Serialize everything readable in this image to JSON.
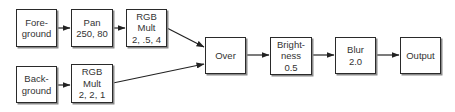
{
  "diagram": {
    "type": "node-graph",
    "colors": {
      "border": "#2a2a2a",
      "shadow": "#8a8a8a",
      "text": "#333333",
      "arrow": "#222222"
    },
    "nodes": {
      "foreground": {
        "lines": [
          "Fore-",
          "ground"
        ]
      },
      "pan": {
        "lines": [
          "Pan",
          "250, 80"
        ]
      },
      "rgb_mult_top": {
        "lines": [
          "RGB",
          "Mult",
          "2, .5, 4"
        ]
      },
      "background": {
        "lines": [
          "Back-",
          "ground"
        ]
      },
      "rgb_mult_bottom": {
        "lines": [
          "RGB",
          "Mult",
          "2, 2, 1"
        ]
      },
      "over": {
        "lines": [
          "Over"
        ]
      },
      "brightness": {
        "lines": [
          "Bright-",
          "ness",
          "0.5"
        ]
      },
      "blur": {
        "lines": [
          "Blur",
          "2.0"
        ]
      },
      "output": {
        "lines": [
          "Output"
        ]
      }
    },
    "edges": [
      {
        "from": "foreground",
        "to": "pan"
      },
      {
        "from": "pan",
        "to": "rgb_mult_top"
      },
      {
        "from": "rgb_mult_top",
        "to": "over"
      },
      {
        "from": "background",
        "to": "rgb_mult_bottom"
      },
      {
        "from": "rgb_mult_bottom",
        "to": "over"
      },
      {
        "from": "over",
        "to": "brightness"
      },
      {
        "from": "brightness",
        "to": "blur"
      },
      {
        "from": "blur",
        "to": "output"
      }
    ]
  }
}
